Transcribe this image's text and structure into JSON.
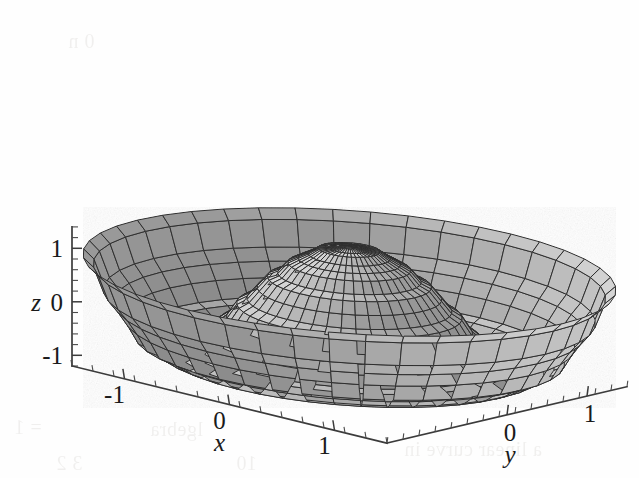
{
  "figure": {
    "kind": "3d-surface-plot",
    "style": "grayscale-mesh-scanned",
    "background_color": "#fefefe",
    "mesh_color": "#2e2e2e",
    "axis_color": "#3b3b3b"
  },
  "chart_data": {
    "type": "surface",
    "title": "",
    "subtitle": "",
    "xlabel": "x",
    "ylabel": "y",
    "zlabel": "z",
    "xlim": [
      -1.5,
      1.5
    ],
    "ylim": [
      -1.5,
      1.5
    ],
    "zlim": [
      -1.2,
      1.4
    ],
    "grid": false,
    "legend": false,
    "legend_position": "none",
    "mesh": "polar",
    "surface_description": "Central rotationally-symmetric dome peaking near z=1.2 at the origin, surrounded by a trough ring and two outer lobes rising again near the x extremes; sinc/bessel-like radial profile",
    "radial_profile": {
      "r": [
        0.0,
        0.2,
        0.4,
        0.6,
        0.8,
        1.0,
        1.2,
        1.4,
        1.6,
        1.8,
        2.0
      ],
      "z": [
        1.25,
        1.18,
        0.95,
        0.58,
        0.12,
        -0.38,
        -0.78,
        -0.95,
        -0.72,
        -0.1,
        0.75
      ]
    },
    "axes": {
      "x": {
        "label": "x",
        "tick_labels": [
          "-1",
          "0",
          "1"
        ],
        "tick_values": [
          -1,
          0,
          1
        ],
        "minor_ticks_per_interval": 4
      },
      "y": {
        "label": "y",
        "tick_labels": [
          "0",
          "1"
        ],
        "tick_values": [
          0,
          1
        ],
        "minor_ticks_per_interval": 4
      },
      "z": {
        "label": "z",
        "tick_labels": [
          "1",
          "0",
          "-1"
        ],
        "tick_values": [
          1,
          0,
          -1
        ],
        "minor_ticks_per_interval": 4
      }
    }
  },
  "labels": {
    "z_top": "1",
    "z_mid": "0",
    "z_bottom": "-1",
    "z_axis_name": "z",
    "x_neg1": "-1",
    "x_zero": "0",
    "x_one": "1",
    "x_axis_name": "x",
    "y_zero": "0",
    "y_one": "1",
    "y_axis_name": "y"
  },
  "bleed_through": {
    "note": "faint mirrored text from reverse of the printed page",
    "lines": [
      {
        "text": "a linear curve in",
        "left": 404,
        "top": 438
      },
      {
        "text": "lgebra",
        "left": 150,
        "top": 418
      },
      {
        "text": "10",
        "left": 236,
        "top": 452
      },
      {
        "text": "= 1",
        "left": 14,
        "top": 416
      },
      {
        "text": "3  2",
        "left": 56,
        "top": 452
      },
      {
        "text": "0 n",
        "left": 68,
        "top": 30
      }
    ]
  }
}
